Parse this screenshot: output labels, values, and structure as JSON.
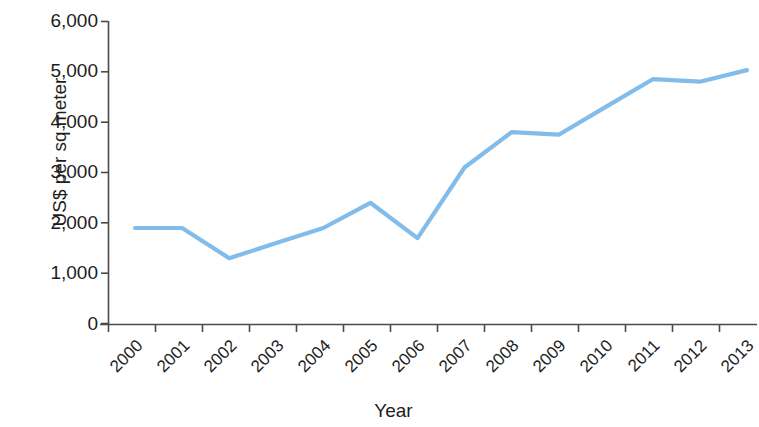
{
  "chart_data": {
    "type": "line",
    "title": "",
    "xlabel": "Year",
    "ylabel": "US$ per sq meter",
    "categories": [
      "2000",
      "2001",
      "2002",
      "2003",
      "2004",
      "2005",
      "2006",
      "2007",
      "2008",
      "2009",
      "2010",
      "2011",
      "2012",
      "2013"
    ],
    "values": [
      1900,
      1900,
      1300,
      1600,
      1900,
      2400,
      1700,
      3100,
      3800,
      3750,
      4300,
      4850,
      4800,
      5030
    ],
    "series": [
      {
        "name": "US$ per sq meter",
        "values": [
          1900,
          1900,
          1300,
          1600,
          1900,
          2400,
          1700,
          3100,
          3800,
          3750,
          4300,
          4850,
          4800,
          5030
        ]
      }
    ],
    "ylim": [
      0,
      6000
    ],
    "yticks": [
      0,
      1000,
      2000,
      3000,
      4000,
      5000,
      6000
    ],
    "ytick_labels": [
      "0",
      "1,000",
      "2,000",
      "3,000",
      "4,000",
      "5,000",
      "6,000"
    ],
    "grid": false,
    "legend": "none",
    "line_color": "#81bcea",
    "axis_color": "#4a4a4a",
    "xtick_rotation": -45
  },
  "axis": {
    "y_label": "US$ per sq meter",
    "x_label": "Year"
  }
}
